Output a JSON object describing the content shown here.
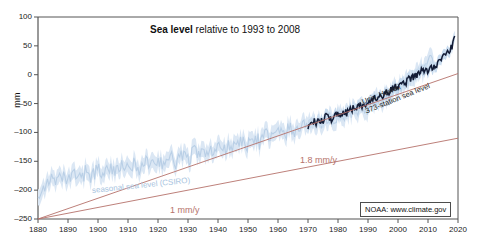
{
  "chart_data": {
    "type": "line",
    "title": "Sea level relative to 1993 to 2008",
    "title_bold_part": "Sea level",
    "title_rest": " relative to 1993 to 2008",
    "xlabel": "",
    "ylabel": "mm",
    "xlim": [
      1880,
      2020
    ],
    "ylim": [
      -250,
      100
    ],
    "grid": false,
    "legend_position": "inline-annotations",
    "xticks": [
      1880,
      1890,
      1900,
      1910,
      1920,
      1930,
      1940,
      1950,
      1960,
      1970,
      1980,
      1990,
      2000,
      2010,
      2020
    ],
    "yticks": [
      100,
      50,
      0,
      -50,
      -100,
      -150,
      -200,
      -250
    ],
    "series": [
      {
        "name": "seasonal sea level (CSIRO)",
        "color": "#b9cfe6",
        "band_color": "#dbe7f4",
        "x": [
          1880,
          1882,
          1884,
          1886,
          1888,
          1890,
          1892,
          1894,
          1896,
          1898,
          1900,
          1902,
          1904,
          1906,
          1908,
          1910,
          1912,
          1914,
          1916,
          1918,
          1920,
          1922,
          1924,
          1926,
          1928,
          1930,
          1932,
          1934,
          1936,
          1938,
          1940,
          1942,
          1944,
          1946,
          1948,
          1950,
          1952,
          1954,
          1956,
          1958,
          1960,
          1962,
          1964,
          1966,
          1968,
          1970,
          1972,
          1974,
          1976,
          1978,
          1980,
          1982,
          1984,
          1986,
          1988,
          1990,
          1992,
          1994,
          1996,
          1998,
          2000,
          2002,
          2004,
          2006,
          2008,
          2010,
          2012
        ],
        "values": [
          -205,
          -192,
          -182,
          -190,
          -178,
          -186,
          -172,
          -181,
          -168,
          -176,
          -163,
          -172,
          -158,
          -168,
          -160,
          -166,
          -155,
          -163,
          -150,
          -158,
          -148,
          -155,
          -142,
          -152,
          -138,
          -146,
          -133,
          -142,
          -128,
          -138,
          -124,
          -132,
          -118,
          -128,
          -113,
          -122,
          -108,
          -118,
          -102,
          -112,
          -98,
          -105,
          -92,
          -100,
          -86,
          -92,
          -80,
          -86,
          -74,
          -80,
          -68,
          -74,
          -62,
          -66,
          -56,
          -58,
          -48,
          -44,
          -36,
          -28,
          -22,
          -16,
          -8,
          0,
          8,
          18,
          26
        ],
        "band_halfwidth": 14
      },
      {
        "name": "Univ. Hawaii 373-station sea level",
        "color": "#131c36",
        "x": [
          1970,
          1972,
          1974,
          1976,
          1978,
          1980,
          1982,
          1984,
          1986,
          1988,
          1990,
          1992,
          1994,
          1996,
          1998,
          2000,
          2002,
          2004,
          2006,
          2008,
          2010,
          2012,
          2014,
          2016,
          2018,
          2019
        ],
        "values": [
          -88,
          -80,
          -84,
          -72,
          -76,
          -66,
          -70,
          -60,
          -58,
          -52,
          -50,
          -44,
          -40,
          -32,
          -26,
          -20,
          -14,
          -8,
          -2,
          6,
          8,
          16,
          24,
          34,
          48,
          62
        ]
      },
      {
        "name": "1 mm/y trend",
        "color": "#b5726b",
        "x": [
          1880,
          2020
        ],
        "values": [
          -250,
          -110
        ]
      },
      {
        "name": "1.8 mm/y trend",
        "color": "#b5726b",
        "x": [
          1880,
          2020
        ],
        "values": [
          -250,
          2
        ]
      }
    ],
    "annotations": [
      {
        "id": "csiro",
        "text": "seasonal sea level (CSIRO)",
        "color": "#a8c4e0"
      },
      {
        "id": "uh-line1",
        "text": "Univ. Hawaii",
        "color": "#222222"
      },
      {
        "id": "uh-line2",
        "text": "373-station sea level",
        "color": "#222222"
      },
      {
        "id": "rate1",
        "text": "1 mm/y",
        "color": "#b5726b"
      },
      {
        "id": "rate2",
        "text": "1.8 mm/y",
        "color": "#b5726b"
      },
      {
        "id": "credit",
        "text": "NOAA: www.climate.gov",
        "color": "#111111"
      }
    ]
  },
  "axes": {
    "ylabel": "mm",
    "ytick_labels": [
      "100",
      "50",
      "0",
      "–50",
      "–100",
      "–150",
      "–200",
      "–250"
    ],
    "xtick_labels": [
      "1880",
      "1890",
      "1900",
      "1910",
      "1920",
      "1930",
      "1940",
      "1950",
      "1960",
      "1970",
      "1980",
      "1990",
      "2000",
      "2010",
      "2020"
    ]
  },
  "title": {
    "bold": "Sea level",
    "rest": " relative to 1993 to 2008"
  },
  "annotations": {
    "csiro": "seasonal sea level (CSIRO)",
    "uh_line1": "Univ. Hawaii",
    "uh_line2": "373-station sea level",
    "rate_slow": "1 mm/y",
    "rate_fast": "1.8 mm/y",
    "credit": "NOAA: www.climate.gov"
  },
  "colors": {
    "csiro_line": "#b9cfe6",
    "csiro_band": "#dbe7f4",
    "hawaii_line": "#131c36",
    "trend": "#b5726b",
    "axis": "#555555",
    "text": "#111111"
  }
}
